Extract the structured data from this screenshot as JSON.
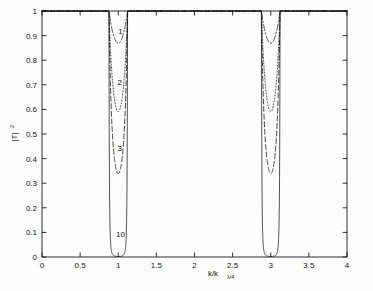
{
  "chart_data": {
    "type": "line",
    "title": "",
    "xlabel": "k/k",
    "xlabel_sub": "λ/4",
    "ylabel": "|T|",
    "ylabel_sup": "2",
    "xlim": [
      0,
      4
    ],
    "ylim": [
      0,
      1
    ],
    "xticks": [
      0,
      0.5,
      1,
      1.5,
      2,
      2.5,
      3,
      3.5,
      4
    ],
    "xticklabels": [
      "0",
      "0.5",
      "1",
      "1.5",
      "2",
      "2.5",
      "3",
      "3.5",
      "4"
    ],
    "yticks": [
      0,
      0.1,
      0.2,
      0.3,
      0.4,
      0.5,
      0.6,
      0.7,
      0.8,
      0.9,
      1
    ],
    "yticklabels": [
      "0",
      "0.1",
      "0.2",
      "0.3",
      "0.4",
      "0.5",
      "0.6",
      "0.7",
      "0.8",
      "0.9",
      "1"
    ],
    "grid": false,
    "legend": "inline-annotations",
    "line_color": "#111111",
    "series": [
      {
        "name": "1",
        "periods": 1,
        "style": "dashdot",
        "min_transmission": 0.855,
        "label_x": 1.03,
        "label_y": 0.905
      },
      {
        "name": "2",
        "periods": 2,
        "style": "dotted",
        "min_transmission": 0.605,
        "label_x": 1.02,
        "label_y": 0.7
      },
      {
        "name": "3",
        "periods": 3,
        "style": "dashed",
        "min_transmission": 0.395,
        "label_x": 1.02,
        "label_y": 0.432
      },
      {
        "name": "10",
        "periods": 10,
        "style": "solid",
        "min_transmission": 0.002,
        "label_x": 1.03,
        "label_y": 0.08
      }
    ],
    "bandgap_centers": [
      1,
      3
    ],
    "annotations": [
      "1",
      "2",
      "3",
      "10"
    ]
  },
  "axes": {
    "x_axis_name": "normalized-wavenumber",
    "y_axis_name": "transmission-squared"
  }
}
